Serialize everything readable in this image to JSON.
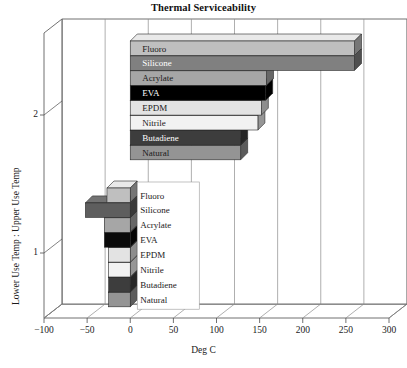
{
  "chart_data": {
    "type": "bar",
    "orientation": "horizontal",
    "title": "Thermal Serviceability",
    "xlabel": "Deg C",
    "ylabel": "Lower Use Temp : Upper Use Temp",
    "xlim": [
      -100,
      300
    ],
    "xticks": [
      -100,
      -50,
      0,
      50,
      100,
      150,
      200,
      250,
      300
    ],
    "xtick_labels": [
      "−100",
      "−50",
      "0",
      "50",
      "100",
      "150",
      "200",
      "250",
      "300"
    ],
    "yticks": [
      1,
      2
    ],
    "ytick_labels": [
      "1",
      "2"
    ],
    "grid": true,
    "style": "3d-horizontal-bar",
    "categories": [
      "Fluoro",
      "Silicone",
      "Acrylate",
      "EVA",
      "EPDM",
      "Nitrile",
      "Butadiene",
      "Natural"
    ],
    "series": [
      {
        "name": "Upper Use Temp",
        "group_index": 2,
        "values": [
          260,
          260,
          158,
          157,
          152,
          148,
          128,
          128
        ]
      },
      {
        "name": "Lower Use Temp",
        "group_index": 1,
        "values": [
          -27,
          -52,
          -30,
          -30,
          -25,
          -25,
          -25,
          -25
        ]
      }
    ],
    "bars_upper": [
      {
        "label": "Fluoro",
        "value": 260,
        "fill": "#bfbfbf",
        "text_color": "dark"
      },
      {
        "label": "Silicone",
        "value": 260,
        "fill": "#808080",
        "text_color": "light"
      },
      {
        "label": "Acrylate",
        "value": 158,
        "fill": "#a6a6a6",
        "text_color": "dark"
      },
      {
        "label": "EVA",
        "value": 157,
        "fill": "#000000",
        "text_color": "light"
      },
      {
        "label": "EPDM",
        "value": 152,
        "fill": "#e3e3e3",
        "text_color": "dark"
      },
      {
        "label": "Nitrile",
        "value": 148,
        "fill": "#f2f2f2",
        "text_color": "dark"
      },
      {
        "label": "Butadiene",
        "value": 128,
        "fill": "#3d3d3d",
        "text_color": "light"
      },
      {
        "label": "Natural",
        "value": 128,
        "fill": "#949494",
        "text_color": "dark"
      }
    ],
    "bars_lower": [
      {
        "label": "Fluoro",
        "value": -27,
        "fill": "#bfbfbf"
      },
      {
        "label": "Silicone",
        "value": -52,
        "fill": "#5e5e5e"
      },
      {
        "label": "Acrylate",
        "value": -30,
        "fill": "#a6a6a6"
      },
      {
        "label": "EVA",
        "value": -30,
        "fill": "#0a0a0a"
      },
      {
        "label": "EPDM",
        "value": -25,
        "fill": "#e3e3e3"
      },
      {
        "label": "Nitrile",
        "value": -25,
        "fill": "#f2f2f2"
      },
      {
        "label": "Butadiene",
        "value": -25,
        "fill": "#3d3d3d"
      },
      {
        "label": "Natural",
        "value": -25,
        "fill": "#949494"
      }
    ]
  },
  "axis": {
    "x_title": "Deg C",
    "y_title": "Lower Use Temp : Upper Use Temp",
    "x_labels": [
      "−100",
      "−50",
      "0",
      "50",
      "100",
      "150",
      "200",
      "250",
      "300"
    ],
    "y_labels": [
      "1",
      "2"
    ]
  },
  "header": {
    "title": "Thermal Serviceability"
  },
  "labels": {
    "upper": [
      "Fluoro",
      "Silicone",
      "Acrylate",
      "EVA",
      "EPDM",
      "Nitrile",
      "Butadiene",
      "Natural"
    ],
    "lower": [
      "Fluoro",
      "Silicone",
      "Acrylate",
      "EVA",
      "EPDM",
      "Nitrile",
      "Butadiene",
      "Natural"
    ]
  },
  "colors": {
    "plot_background": "#ffffff",
    "grid": "#8c8c8c",
    "axis": "#4d4d4d",
    "text": "#1a1a1a"
  }
}
